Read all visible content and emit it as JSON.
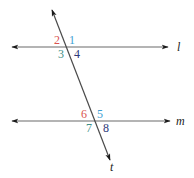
{
  "diagram": {
    "colors": {
      "line": "#6b6b6b",
      "arrow": "#1a1a1a",
      "angle_top_left": "#d9534f",
      "angle_top_right": "#3d9fd3",
      "angle_bottom_left": "#3f8f86",
      "angle_bottom_right": "#2e3a7a"
    },
    "lines": [
      {
        "name": "l",
        "label": "l",
        "type": "horizontal",
        "y": 47,
        "x1": 12,
        "x2": 168,
        "label_x": 177,
        "label_y": 51
      },
      {
        "name": "m",
        "label": "m",
        "type": "horizontal",
        "y": 121,
        "x1": 12,
        "x2": 170,
        "label_x": 176,
        "label_y": 125
      },
      {
        "name": "t",
        "label": "t",
        "type": "transversal",
        "x1": 52,
        "y1": 10,
        "x2": 110,
        "y2": 160,
        "label_x": 110,
        "label_y": 171
      }
    ],
    "intersections": [
      {
        "lines": [
          "l",
          "t"
        ],
        "angles": [
          {
            "label": "2",
            "position": "top-left",
            "x": 54,
            "y": 44
          },
          {
            "label": "1",
            "position": "top-right",
            "x": 69,
            "y": 44
          },
          {
            "label": "3",
            "position": "bottom-left",
            "x": 58,
            "y": 58
          },
          {
            "label": "4",
            "position": "bottom-right",
            "x": 74,
            "y": 58
          }
        ]
      },
      {
        "lines": [
          "m",
          "t"
        ],
        "angles": [
          {
            "label": "6",
            "position": "top-left",
            "x": 81,
            "y": 118
          },
          {
            "label": "5",
            "position": "top-right",
            "x": 97,
            "y": 118
          },
          {
            "label": "7",
            "position": "bottom-left",
            "x": 86,
            "y": 132
          },
          {
            "label": "8",
            "position": "bottom-right",
            "x": 103,
            "y": 132
          }
        ]
      }
    ]
  }
}
